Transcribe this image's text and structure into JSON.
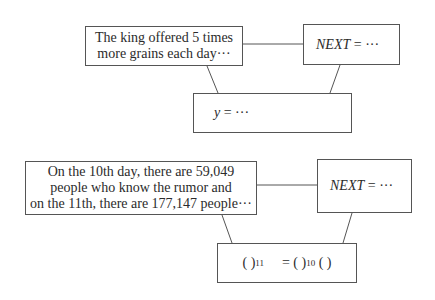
{
  "diagram1": {
    "story_box": {
      "lines": [
        "The king offered 5 times",
        "more grains each day···"
      ]
    },
    "next_box": {
      "var": "NEXT",
      "rest": " = ···"
    },
    "formula_box": {
      "var": "y",
      "rest": " = ···"
    }
  },
  "diagram2": {
    "story_box": {
      "lines": [
        "On the 10th day, there are 59,049",
        "people who know the rumor and",
        "on the 11th, there are 177,147 people···"
      ]
    },
    "next_box": {
      "var": "NEXT",
      "rest": " = ···"
    },
    "formula_box": {
      "lhs_base": "( )",
      "lhs_exp": "11",
      "eq": "= ( )",
      "rhs_exp": "10",
      "rhs_tail": " ( )"
    }
  },
  "colors": {
    "border": "#555555",
    "text": "#2b2b2b",
    "background": "#ffffff"
  }
}
